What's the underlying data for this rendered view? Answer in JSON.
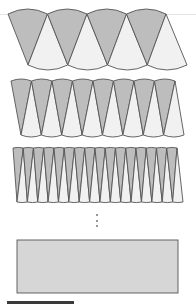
{
  "figure": {
    "colors": {
      "shaded_sector": "#bdbdbd",
      "light_sector": "#f1f1f1",
      "outline": "#555555",
      "rectangle_fill": "#d6d6d6",
      "dots": "#666666"
    },
    "rows": [
      {
        "name": "row-8-sectors",
        "pairs": 4,
        "top": 14,
        "bottom": 65,
        "top_left": 8,
        "top_right": 166,
        "bottom_left": 28,
        "bottom_right": 187,
        "bulge": 5
      },
      {
        "name": "row-16-sectors",
        "pairs": 8,
        "top": 81,
        "bottom": 135,
        "top_left": 11,
        "top_right": 175,
        "bottom_left": 21,
        "bottom_right": 184,
        "bulge": 2
      },
      {
        "name": "row-32-sectors",
        "pairs": 16,
        "top": 148,
        "bottom": 202,
        "top_left": 13,
        "top_right": 177,
        "bottom_left": 17,
        "bottom_right": 183,
        "bulge": 0.6
      }
    ],
    "ellipsis_dots": {
      "x": 97,
      "ys": [
        215,
        221,
        226
      ]
    },
    "limit_rectangle": {
      "x": 17,
      "y": 240,
      "width": 161,
      "height": 53
    }
  }
}
